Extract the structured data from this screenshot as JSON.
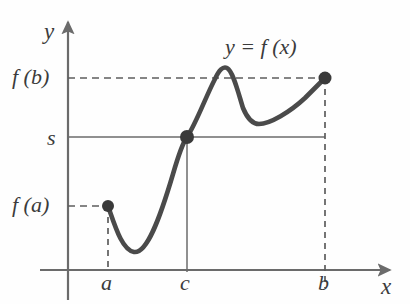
{
  "figure": {
    "background_color": "#fefefe",
    "axis_color": "#6b6b6b",
    "curve_color": "#4a4a4a",
    "guide_color": "#6b6b6b",
    "point_color": "#3a3a3a",
    "text_color": "#3b3b3b"
  },
  "labels": {
    "y_axis": "y",
    "x_axis": "x",
    "f_of_b": "f (b)",
    "s": "s",
    "f_of_a": "f (a)",
    "tick_a": "a",
    "tick_c": "c",
    "tick_b": "b",
    "curve_equation": "y = f (x)"
  },
  "chart_data": {
    "type": "line",
    "title": "y = f (x)",
    "xlabel": "x",
    "ylabel": "y",
    "grid": false,
    "legend": null,
    "axis_origin_px": {
      "x": 68,
      "y": 270
    },
    "x_axis_range_px": [
      40,
      392
    ],
    "y_axis_range_px": [
      270,
      20
    ],
    "x_tick_labels": [
      "a",
      "c",
      "b"
    ],
    "x_tick_positions_px": [
      108,
      187,
      325
    ],
    "y_tick_labels": [
      "f (a)",
      "s",
      "f (b)"
    ],
    "y_tick_positions_px": [
      206,
      137,
      78
    ],
    "marked_points": [
      {
        "name": "left-endpoint",
        "label": "(a, f (a))",
        "x_px": 108,
        "y_px": 206
      },
      {
        "name": "intermediate-point",
        "label": "(c, s)",
        "x_px": 187,
        "y_px": 137
      },
      {
        "name": "right-endpoint",
        "label": "(b, f (b))",
        "x_px": 325,
        "y_px": 78
      }
    ],
    "curve_path_px": "M 108 206 C 115 226, 122 250, 134 252 C 147 254, 160 218, 173 174 C 180 150, 184 141, 187 137 C 196 124, 206 96, 215 79 C 219 70, 223 66, 227 68 C 233 71, 238 92, 243 108 C 248 120, 253 124, 259 124 C 270 124, 290 112, 305 98 C 313 90, 320 83, 325 78",
    "guides": [
      {
        "name": "fb-horizontal",
        "style": "dashed",
        "from_px": [
          68,
          78
        ],
        "to_px": [
          325,
          78
        ]
      },
      {
        "name": "s-horizontal",
        "style": "solid",
        "from_px": [
          68,
          137
        ],
        "to_px": [
          325,
          137
        ]
      },
      {
        "name": "fa-horizontal",
        "style": "dashed",
        "from_px": [
          68,
          206
        ],
        "to_px": [
          108,
          206
        ]
      },
      {
        "name": "a-vertical",
        "style": "dashed",
        "from_px": [
          108,
          206
        ],
        "to_px": [
          108,
          270
        ]
      },
      {
        "name": "c-vertical",
        "style": "solid",
        "from_px": [
          187,
          137
        ],
        "to_px": [
          187,
          270
        ]
      },
      {
        "name": "b-vertical",
        "style": "dashed",
        "from_px": [
          325,
          78
        ],
        "to_px": [
          325,
          288
        ]
      }
    ]
  }
}
